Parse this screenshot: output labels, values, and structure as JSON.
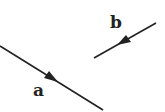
{
  "diagram": {
    "vectors": [
      {
        "label": "a",
        "from": [
          0,
          46
        ],
        "to": [
          103,
          110
        ],
        "arrow_at": 0.55,
        "direction": "down-right"
      },
      {
        "label": "b",
        "from": [
          156,
          23
        ],
        "to": [
          94,
          58
        ],
        "arrow_at": 0.55,
        "direction": "down-left"
      }
    ],
    "labels": {
      "a": "a",
      "b": "b"
    },
    "color": "#222222"
  }
}
